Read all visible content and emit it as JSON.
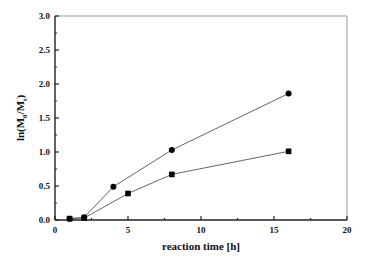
{
  "chart_data": {
    "type": "line",
    "title": "",
    "xlabel": "reaction time [h]",
    "ylabel_parts": {
      "pre": "ln(M",
      "sub0": "0",
      "mid": "/M",
      "sub1": "t",
      "post": ")"
    },
    "ylabel": "ln(M0/Mt)",
    "xlim": [
      0,
      20
    ],
    "ylim": [
      0.0,
      3.0
    ],
    "xticks": [
      0,
      5,
      10,
      15,
      20
    ],
    "xtick_labels": [
      "0",
      "5",
      "10",
      "15",
      "20"
    ],
    "xminor": [
      2.5,
      7.5,
      12.5,
      17.5
    ],
    "yticks": [
      0.0,
      0.5,
      1.0,
      1.5,
      2.0,
      2.5,
      3.0
    ],
    "ytick_labels": [
      "0.0",
      "0.5",
      "1.0",
      "1.5",
      "2.0",
      "2.5",
      "3.0"
    ],
    "yminor": [
      0.25,
      0.75,
      1.25,
      1.75,
      2.25,
      2.75
    ],
    "grid": false,
    "legend": "none",
    "series": [
      {
        "name": "circle series",
        "marker": "circle",
        "x": [
          1,
          2,
          4,
          8,
          16
        ],
        "y": [
          0.02,
          0.04,
          0.49,
          1.03,
          1.86
        ]
      },
      {
        "name": "square series",
        "marker": "square",
        "x": [
          1,
          2,
          5,
          8,
          16
        ],
        "y": [
          0.02,
          0.03,
          0.39,
          0.67,
          1.01
        ]
      }
    ]
  }
}
